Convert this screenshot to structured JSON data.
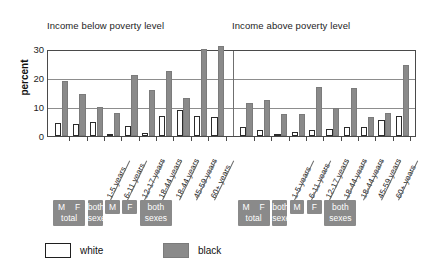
{
  "chart_data": {
    "type": "bar",
    "title": "",
    "panels": [
      {
        "title": "Income below poverty level",
        "categories": [
          "M total",
          "F total",
          "both sexes",
          "1-5 years",
          "6-11 years",
          "12-17 years",
          "18-44 years",
          "18-44 years",
          "45-59 years",
          "60+ years"
        ],
        "series": [
          {
            "name": "white",
            "values": [
              4.5,
              4.0,
              5.0,
              0.5,
              3.5,
              1.0,
              7.0,
              9.0,
              7.0,
              6.5
            ]
          },
          {
            "name": "black",
            "values": [
              19.0,
              14.5,
              10.0,
              8.0,
              21.0,
              16.0,
              22.5,
              13.0,
              30.0,
              31.0
            ]
          }
        ]
      },
      {
        "title": "Income above poverty level",
        "categories": [
          "M total",
          "F total",
          "both sexes",
          "1-5 years",
          "6-11 years",
          "12-17 years",
          "18-44 years",
          "18-44 years",
          "45-59 years",
          "60+ years"
        ],
        "series": [
          {
            "name": "white",
            "values": [
              3.0,
              2.0,
              0.5,
              1.5,
              2.0,
              2.5,
              3.0,
              3.0,
              5.5,
              7.0
            ]
          },
          {
            "name": "black",
            "values": [
              11.5,
              12.5,
              7.5,
              7.5,
              17.0,
              9.5,
              16.5,
              6.5,
              8.0,
              24.5
            ]
          }
        ]
      }
    ],
    "ylabel": "percent",
    "xlabel": "",
    "ylim": [
      0,
      30
    ],
    "yticks": [
      0,
      10,
      20,
      30
    ],
    "ytick_labels": [
      "0",
      "10",
      "20",
      "30"
    ],
    "grid": true,
    "legend": {
      "position": "bottom-left",
      "entries": [
        {
          "label": "white",
          "color": "#ffffff"
        },
        {
          "label": "black",
          "color": "#8a8a8a"
        }
      ]
    },
    "group_labels": [
      {
        "line1": "M    F",
        "line2": "total"
      },
      {
        "line1": "both",
        "line2": "sexes"
      },
      {
        "line1": "M",
        "line2": ""
      },
      {
        "line1": "F",
        "line2": ""
      },
      {
        "line1": "both",
        "line2": "sexes"
      }
    ]
  },
  "axis": {
    "ylabel": "percent",
    "ytick_labels": [
      "30",
      "20",
      "10",
      "0"
    ]
  },
  "panel_titles": {
    "left": "Income below poverty level",
    "right": "Income above poverty level"
  },
  "age_labels": [
    "1-5 years",
    "6-11 years",
    "12-17 years",
    "18-44 years",
    "18-44 years",
    "45-59 years",
    "60+ years"
  ],
  "category_boxes": {
    "mf_total": {
      "m": "M",
      "f": "F",
      "sub": "total"
    },
    "both_sexes": {
      "l1": "both",
      "l2": "sexes"
    },
    "m": "M",
    "f": "F"
  },
  "legend": {
    "white": "white",
    "black": "black"
  }
}
